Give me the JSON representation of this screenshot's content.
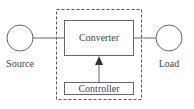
{
  "diagram": {
    "nodes": {
      "source": {
        "label": "Source",
        "shape": "circle"
      },
      "load": {
        "label": "Load",
        "shape": "circle"
      },
      "converter": {
        "label": "Converter",
        "shape": "rectangle"
      },
      "controller": {
        "label": "Controller",
        "shape": "rectangle"
      }
    },
    "group": {
      "style": "dashed",
      "members": [
        "converter",
        "controller"
      ]
    },
    "edges": [
      {
        "from": "source",
        "to": "converter",
        "style": "line"
      },
      {
        "from": "converter",
        "to": "load",
        "style": "line"
      },
      {
        "from": "controller",
        "to": "converter",
        "style": "arrow"
      }
    ],
    "colors": {
      "stroke": "#555555",
      "text": "#444444",
      "background": "#ffffff"
    }
  }
}
